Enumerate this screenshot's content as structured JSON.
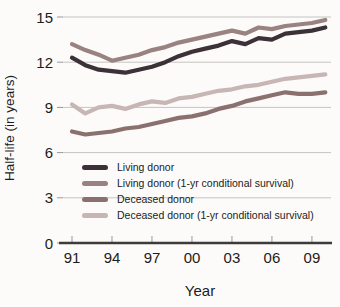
{
  "chart_data": {
    "type": "line",
    "title": "",
    "xlabel": "Year",
    "ylabel": "Half-life (in years)",
    "x_start_year": 1991,
    "x_years": [
      1991,
      1992,
      1993,
      1994,
      1995,
      1996,
      1997,
      1998,
      1999,
      2000,
      2001,
      2002,
      2003,
      2004,
      2005,
      2006,
      2007,
      2008,
      2009,
      2010
    ],
    "x_tick_labels": [
      "91",
      "94",
      "97",
      "00",
      "03",
      "06",
      "09"
    ],
    "x_tick_step_years": 3,
    "ylim": [
      0,
      15
    ],
    "yticks": [
      0,
      3,
      6,
      9,
      12,
      15
    ],
    "grid": "horizontal",
    "legend_position": "inside-bottom-left",
    "series": [
      {
        "name": "Living donor",
        "color": "#3c3136",
        "values": [
          12.3,
          11.8,
          11.5,
          11.4,
          11.3,
          11.5,
          11.7,
          12.0,
          12.4,
          12.7,
          12.9,
          13.1,
          13.4,
          13.2,
          13.6,
          13.5,
          13.9,
          14.0,
          14.1,
          14.3
        ]
      },
      {
        "name": "Living donor (1-yr conditional survival)",
        "color": "#9a8280",
        "values": [
          13.2,
          12.8,
          12.5,
          12.1,
          12.3,
          12.5,
          12.8,
          13.0,
          13.3,
          13.5,
          13.7,
          13.9,
          14.1,
          13.9,
          14.3,
          14.2,
          14.4,
          14.5,
          14.6,
          14.8
        ]
      },
      {
        "name": "Deceased donor",
        "color": "#8a7170",
        "values": [
          7.4,
          7.2,
          7.3,
          7.4,
          7.6,
          7.7,
          7.9,
          8.1,
          8.3,
          8.4,
          8.6,
          8.9,
          9.1,
          9.4,
          9.6,
          9.8,
          10.0,
          9.9,
          9.9,
          10.0
        ]
      },
      {
        "name": "Deceased donor (1-yr conditional survival)",
        "color": "#c7b6b4",
        "values": [
          9.2,
          8.6,
          9.0,
          9.1,
          8.9,
          9.2,
          9.4,
          9.3,
          9.6,
          9.7,
          9.9,
          10.1,
          10.2,
          10.4,
          10.5,
          10.7,
          10.9,
          11.0,
          11.1,
          11.2
        ]
      }
    ],
    "colors": {
      "background": "#fcfbfa",
      "grid": "#c6c4c2",
      "tick": "#9b9998",
      "axis": "#3d3a3a",
      "text": "#1c1c1c"
    }
  }
}
